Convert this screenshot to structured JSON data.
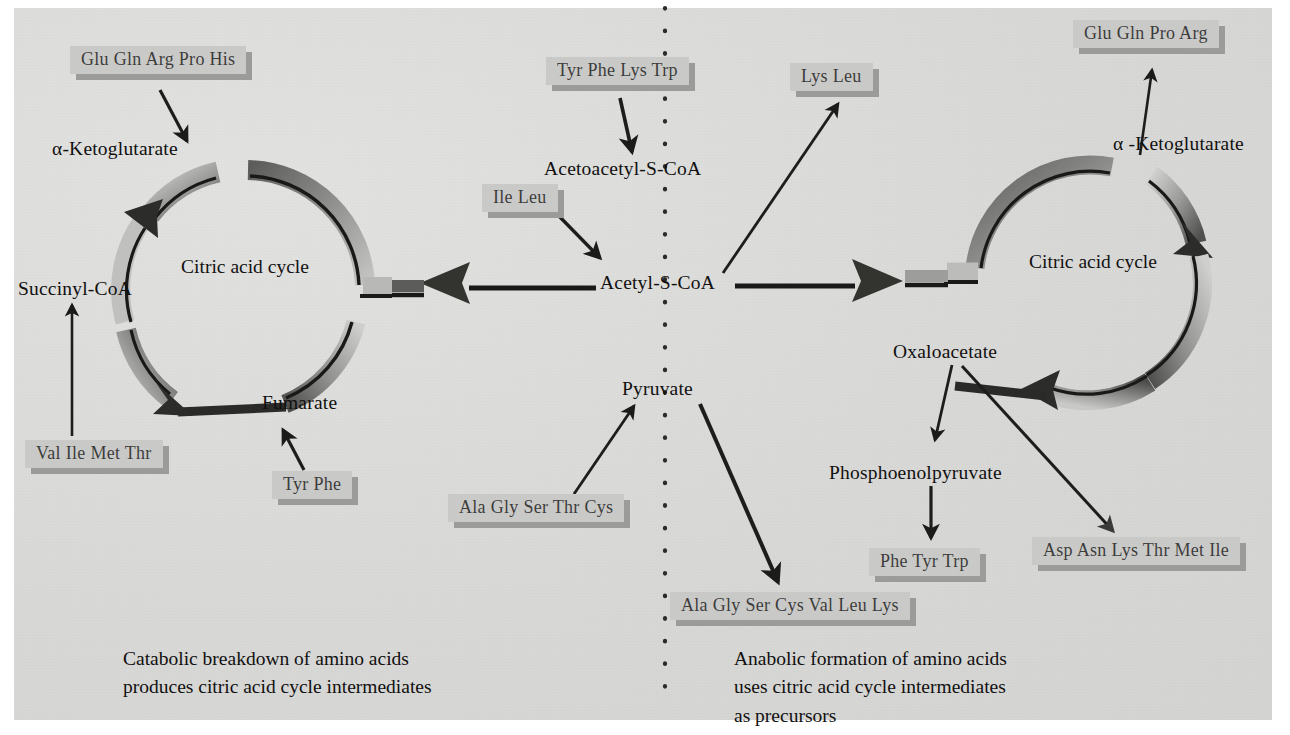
{
  "figure": {
    "background_color": "#dcdcda",
    "tag_color": "#c9c9c7",
    "tag_shadow_color": "#9b9b99",
    "text_color": "#111010",
    "divider": "vertical-dotted-line"
  },
  "left_panel": {
    "cycle_label": "Citric acid\ncycle",
    "metabolites": {
      "ketoglutarate": "α-Ketoglutarate",
      "succinyl_coa": "Succinyl-CoA",
      "fumarate": "Fumarate"
    },
    "tags": {
      "glu_gln_arg_pro_his": "Glu Gln Arg Pro His",
      "val_ile_met_thr": "Val Ile Met Thr",
      "tyr_phe": "Tyr Phe"
    },
    "caption": "Catabolic breakdown of amino acids\nproduces citric acid cycle intermediates"
  },
  "center_panel": {
    "metabolites": {
      "acetoacetyl_s_coa": "Acetoacetyl-S-CoA",
      "acetyl_s_coa": "Acetyl-S-CoA",
      "pyruvate": "Pyruvate"
    },
    "tags": {
      "tyr_phe_lys_trp": "Tyr Phe Lys Trp",
      "ile_leu": "Ile Leu",
      "lys_leu": "Lys Leu",
      "ala_gly_ser_thr_cys": "Ala Gly Ser Thr Cys",
      "ala_gly_ser_cys_val_leu_lys": "Ala Gly Ser Cys Val Leu Lys"
    }
  },
  "right_panel": {
    "cycle_label": "Citric acid\ncycle",
    "metabolites": {
      "ketoglutarate": "α -Ketoglutarate",
      "oxaloacetate": "Oxaloacetate",
      "phosphoenolpyruvate": "Phosphoenolpyruvate"
    },
    "tags": {
      "glu_gln_pro_arg": "Glu Gln Pro Arg",
      "phe_tyr_trp": "Phe Tyr Trp",
      "asp_asn_lys_thr_met_ile": "Asp Asn Lys Thr Met Ile"
    },
    "caption": "Anabolic formation of amino acids\nuses citric acid cycle intermediates\nas precursors"
  }
}
